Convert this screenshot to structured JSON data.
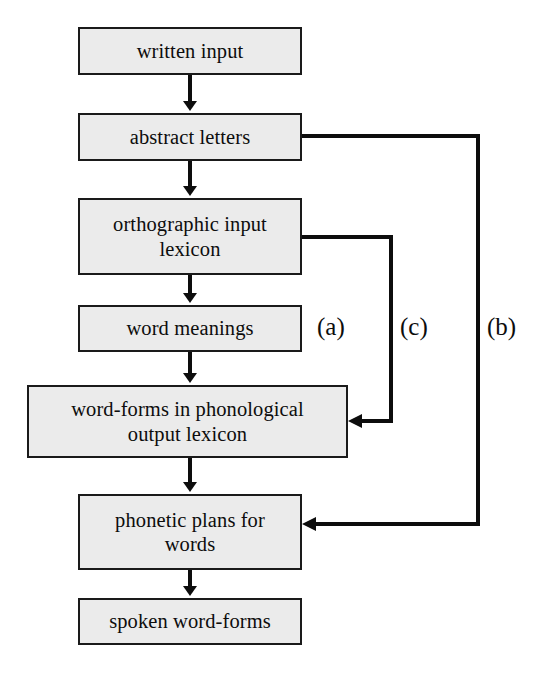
{
  "diagram": {
    "background_color": "#ffffff",
    "node_fill_color": "#ebebeb",
    "node_border_color": "#1a1a1a",
    "line_color": "#0d0d0d",
    "nodes": [
      {
        "id": "written-input",
        "label": "written input",
        "x": 78,
        "y": 27,
        "w": 224,
        "h": 48
      },
      {
        "id": "abstract-letters",
        "label": "abstract letters",
        "x": 78,
        "y": 113,
        "w": 224,
        "h": 48
      },
      {
        "id": "orthographic-input-lexicon",
        "label": "orthographic input\nlexicon",
        "x": 78,
        "y": 198,
        "w": 224,
        "h": 77
      },
      {
        "id": "word-meanings",
        "label": "word meanings",
        "x": 78,
        "y": 305,
        "w": 224,
        "h": 47
      },
      {
        "id": "word-forms-phonological-output-lexicon",
        "label": "word-forms in phonological\noutput lexicon",
        "x": 27,
        "y": 385,
        "w": 321,
        "h": 73
      },
      {
        "id": "phonetic-plans-for-words",
        "label": "phonetic plans for\nwords",
        "x": 78,
        "y": 494,
        "w": 224,
        "h": 76
      },
      {
        "id": "spoken-word-forms",
        "label": "spoken word-forms",
        "x": 78,
        "y": 598,
        "w": 224,
        "h": 47
      }
    ],
    "route_labels": [
      {
        "id": "route-a",
        "label": "(a)",
        "x": 317,
        "y": 314
      },
      {
        "id": "route-c",
        "label": "(c)",
        "x": 400,
        "y": 314
      },
      {
        "id": "route-b",
        "label": "(b)",
        "x": 487,
        "y": 314
      }
    ],
    "edges": [
      {
        "id": "edge-written-input-to-abstract-letters",
        "from": "written-input",
        "to": "abstract-letters",
        "kind": "vertical-arrow",
        "points": "190,75 190,109"
      },
      {
        "id": "edge-abstract-letters-to-orthographic-lexicon",
        "from": "abstract-letters",
        "to": "orthographic-input-lexicon",
        "kind": "vertical-arrow",
        "points": "190,161 190,194"
      },
      {
        "id": "edge-orthographic-lexicon-to-word-meanings",
        "from": "orthographic-input-lexicon",
        "to": "word-meanings",
        "kind": "vertical-arrow",
        "points": "190,275 190,301"
      },
      {
        "id": "edge-word-meanings-to-word-forms",
        "from": "word-meanings",
        "to": "word-forms-phonological-output-lexicon",
        "kind": "vertical-arrow",
        "label": "(a)",
        "points": "190,352 190,381"
      },
      {
        "id": "edge-word-forms-to-phonetic-plans",
        "from": "word-forms-phonological-output-lexicon",
        "to": "phonetic-plans-for-words",
        "kind": "vertical-arrow",
        "points": "190,458 190,490"
      },
      {
        "id": "edge-phonetic-plans-to-spoken-word-forms",
        "from": "phonetic-plans-for-words",
        "to": "spoken-word-forms",
        "kind": "vertical-arrow",
        "points": "190,570 190,594"
      },
      {
        "id": "edge-route-c-orthographic-lexicon-to-word-forms",
        "from": "orthographic-input-lexicon",
        "to": "word-forms-phonological-output-lexicon",
        "kind": "routed-arrow",
        "label": "(c)",
        "points": "302,237 391,237 391,421 352,421"
      },
      {
        "id": "edge-route-b-abstract-letters-to-phonetic-plans",
        "from": "abstract-letters",
        "to": "phonetic-plans-for-words",
        "kind": "routed-arrow",
        "label": "(b)",
        "points": "302,136 478,136 478,524 306,524"
      }
    ]
  }
}
